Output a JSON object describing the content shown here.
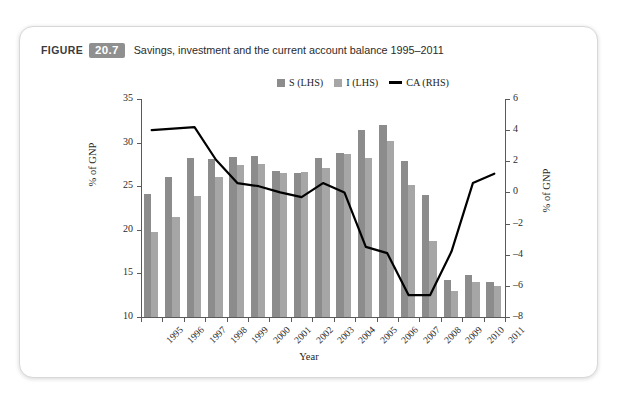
{
  "caption": {
    "word": "FIGURE",
    "number": "20.7",
    "text": "Savings, investment and the current account balance 1995–2011"
  },
  "chart_data": {
    "type": "bar",
    "title": "Savings, investment and the current account balance 1995–2011",
    "xlabel": "Year",
    "ylabel": "% of GNP",
    "ylabel_right": "% of GNP",
    "grid": false,
    "legend_position": "top-center",
    "ylim": [
      10,
      35
    ],
    "ylim_right": [
      -8,
      6
    ],
    "yticks": [
      10,
      15,
      20,
      25,
      30,
      35
    ],
    "yticks_right": [
      -8,
      -6,
      -4,
      -2,
      0,
      2,
      4,
      6
    ],
    "categories": [
      "1995",
      "1996",
      "1997",
      "1998",
      "1999",
      "2000",
      "2001",
      "2002",
      "2003",
      "2004",
      "2005",
      "2006",
      "2007",
      "2008",
      "2009",
      "2010",
      "2011"
    ],
    "series": [
      {
        "name": "S (LHS)",
        "axis": "left",
        "type": "bar",
        "color": "#8c8c8c",
        "values": [
          24.1,
          26.0,
          28.2,
          28.1,
          28.4,
          28.5,
          26.8,
          26.5,
          28.2,
          28.8,
          31.5,
          32.0,
          27.9,
          24.0,
          14.3,
          14.8,
          14.0
        ]
      },
      {
        "name": "I (LHS)",
        "axis": "left",
        "type": "bar",
        "color": "#a6a6a6",
        "values": [
          19.8,
          21.5,
          23.9,
          26.1,
          27.4,
          27.6,
          26.5,
          26.6,
          27.1,
          28.7,
          28.2,
          30.2,
          25.1,
          18.7,
          13.0,
          14.0,
          13.5
        ]
      },
      {
        "name": "CA (RHS)",
        "axis": "right",
        "type": "line",
        "color": "#000000",
        "values": [
          4.0,
          4.1,
          4.2,
          2.1,
          0.6,
          0.4,
          0.0,
          -0.3,
          0.6,
          0.0,
          -3.5,
          -3.9,
          -6.6,
          -6.6,
          -3.8,
          0.6,
          1.2
        ]
      }
    ]
  },
  "legend": {
    "items": [
      {
        "label": "S (LHS)",
        "marker": "square"
      },
      {
        "label": "I (LHS)",
        "marker": "square"
      },
      {
        "label": "CA (RHS)",
        "marker": "line"
      }
    ]
  }
}
